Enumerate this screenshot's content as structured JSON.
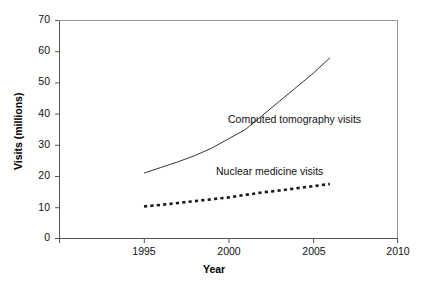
{
  "chart_data": {
    "type": "line",
    "title": "",
    "xlabel": "Year",
    "ylabel": "Visits (millions)",
    "xlim": [
      1990,
      2010
    ],
    "ylim": [
      0,
      70
    ],
    "xticks": [
      1990,
      1995,
      2000,
      2005,
      2010
    ],
    "xtick_labels": [
      "",
      "1995",
      "2000",
      "2005",
      "2010"
    ],
    "yticks": [
      0,
      10,
      20,
      30,
      40,
      50,
      60,
      70
    ],
    "ytick_labels": [
      "0",
      "10",
      "20",
      "30",
      "40",
      "50",
      "60",
      "70"
    ],
    "grid": false,
    "legend_position": "inline-annotation",
    "series": [
      {
        "name": "Computed tomography visits",
        "style": "solid",
        "color": "#333333",
        "x": [
          1995,
          1996,
          1997,
          1998,
          1999,
          2000,
          2001,
          2002,
          2003,
          2004,
          2005,
          2006
        ],
        "values": [
          21.0,
          22.8,
          24.6,
          26.6,
          29.0,
          32.0,
          35.0,
          39.5,
          44.0,
          48.5,
          53.0,
          58.0
        ]
      },
      {
        "name": "Nuclear medicine visits",
        "style": "dotted",
        "color": "#1a1a1a",
        "x": [
          1995,
          1996,
          1997,
          1998,
          1999,
          2000,
          2001,
          2002,
          2003,
          2004,
          2005,
          2006
        ],
        "values": [
          10.3,
          10.8,
          11.4,
          12.0,
          12.6,
          13.2,
          14.0,
          14.8,
          15.4,
          16.1,
          16.8,
          17.5
        ]
      }
    ],
    "annotations": [
      {
        "text": "Computed tomography visits",
        "x": 2003.0,
        "y": 38.5
      },
      {
        "text": "Nuclear medicine visits",
        "x": 2002.2,
        "y": 21.2
      }
    ]
  },
  "axis": {
    "y_title": "Visits (millions)",
    "x_title": "Year"
  },
  "labels": {
    "y70": "70",
    "y60": "60",
    "y50": "50",
    "y40": "40",
    "y30": "30",
    "y20": "20",
    "y10": "10",
    "y0": "0",
    "x1995": "1995",
    "x2000": "2000",
    "x2005": "2005",
    "x2010": "2010",
    "series_ct": "Computed tomography visits",
    "series_nm": "Nuclear medicine visits"
  }
}
